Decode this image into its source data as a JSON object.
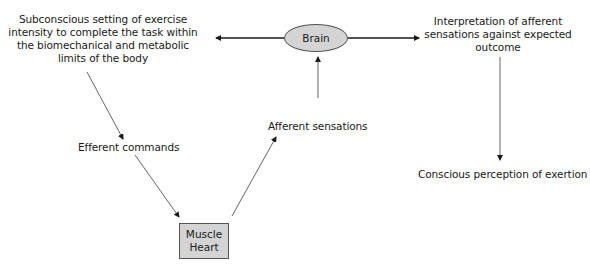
{
  "nodes": {
    "brain": {
      "label": "Brain"
    },
    "muscle_heart": {
      "line1": "Muscle",
      "line2": "Heart"
    }
  },
  "labels": {
    "subconscious": [
      "Subconscious setting of exercise",
      "intensity to complete the task within",
      "the biomechanical and metabolic",
      "limits of the body"
    ],
    "interpretation": [
      "Interpretation of afferent",
      "sensations against expected",
      "outcome"
    ],
    "efferent_commands": "Efferent commands",
    "afferent_sensations": "Afferent sensations",
    "conscious_perception": "Conscious perception of exertion"
  },
  "colors": {
    "node_fill": "#d4d4d4",
    "node_border": "#555555",
    "line": "#333333"
  }
}
